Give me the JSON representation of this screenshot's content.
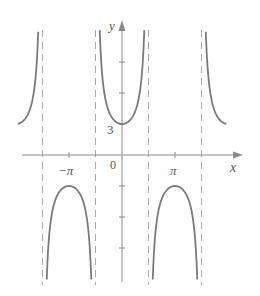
{
  "chart_data": {
    "type": "line",
    "title": "",
    "function": "y = 3 sec x",
    "xlabel": "x",
    "ylabel": "y",
    "x_tick_labels": [
      "-π",
      "0",
      "π"
    ],
    "x_ticks": [
      -3.14159,
      3.14159
    ],
    "y_tick_labels": [
      "3"
    ],
    "y_ticks": [
      -9,
      -6,
      -3,
      3,
      6,
      9
    ],
    "xlim": [
      -6.6,
      7.1
    ],
    "ylim": [
      -12,
      13
    ],
    "asymptotes": [
      -4.712,
      -1.571,
      1.571,
      4.712
    ],
    "grid": false,
    "legend": null,
    "series": [
      {
        "name": "3 sec x (branch 1)",
        "x_range": [
          -6.0,
          -4.712
        ],
        "values_note": "rising to +∞",
        "sample": [
          [
            -6.0,
            3.1
          ],
          [
            -5.5,
            4.2
          ],
          [
            -5.0,
            10.5
          ]
        ]
      },
      {
        "name": "3 sec x (branch 2)",
        "x_range": [
          -4.712,
          -1.571
        ],
        "values_note": "max -3 at -π",
        "sample": [
          [
            -4.0,
            -4.6
          ],
          [
            -3.14159,
            -3.0
          ],
          [
            -2.3,
            -4.5
          ]
        ]
      },
      {
        "name": "3 sec x (branch 3)",
        "x_range": [
          -1.571,
          1.571
        ],
        "values_note": "min 3 at 0",
        "sample": [
          [
            -1.2,
            8.3
          ],
          [
            0,
            3.0
          ],
          [
            1.2,
            8.3
          ]
        ]
      },
      {
        "name": "3 sec x (branch 4)",
        "x_range": [
          1.571,
          4.712
        ],
        "values_note": "max -3 at π",
        "sample": [
          [
            2.3,
            -4.5
          ],
          [
            3.14159,
            -3.0
          ],
          [
            4.0,
            -4.6
          ]
        ]
      },
      {
        "name": "3 sec x (branch 5)",
        "x_range": [
          4.712,
          6.0
        ],
        "values_note": "falling from +∞",
        "sample": [
          [
            5.0,
            10.5
          ],
          [
            5.5,
            4.2
          ],
          [
            6.0,
            3.1
          ]
        ]
      }
    ]
  },
  "labels": {
    "y_axis": "y",
    "x_axis": "x",
    "origin": "0",
    "y_value_3": "3",
    "neg_pi": "−π",
    "pi": "π"
  },
  "style": {
    "curve_color": "#7a7a7a",
    "axis_color": "#8a8a8a",
    "asymptote_color": "#a8a8a8"
  }
}
